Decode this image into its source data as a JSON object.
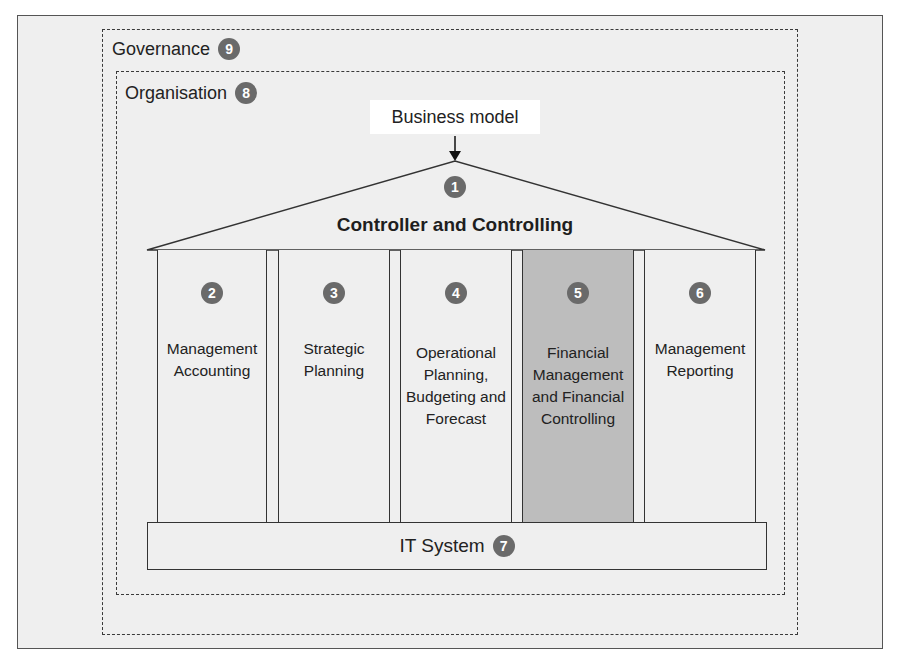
{
  "governance": {
    "label": "Governance",
    "number": "9"
  },
  "organisation": {
    "label": "Organisation",
    "number": "8"
  },
  "business_model": {
    "label": "Business model"
  },
  "roof": {
    "title": "Controller and Controlling",
    "number": "1"
  },
  "pillars": [
    {
      "number": "2",
      "label": "Management Accounting",
      "highlighted": false
    },
    {
      "number": "3",
      "label": "Strategic Planning",
      "highlighted": false
    },
    {
      "number": "4",
      "label": "Operational Planning, Budgeting and Forecast",
      "highlighted": false
    },
    {
      "number": "5",
      "label": "Financial Management and Financial Controlling",
      "highlighted": true
    },
    {
      "number": "6",
      "label": "Management Reporting",
      "highlighted": false
    }
  ],
  "base": {
    "label": "IT System",
    "number": "7"
  },
  "colors": {
    "badge": "#6a6a6a",
    "highlight": "#bdbdbd",
    "background": "#efefef"
  }
}
